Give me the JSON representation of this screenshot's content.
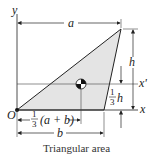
{
  "diagram": {
    "caption": "Triangular area",
    "labels": {
      "y_axis": "y",
      "x_axis": "x",
      "x_prime_axis": "x'",
      "origin": "O",
      "dim_a": "a",
      "dim_b": "b",
      "dim_h": "h",
      "centroid_x_num": "1",
      "centroid_x_den": "3",
      "centroid_x_expr": "(a + b)",
      "centroid_y_num": "1",
      "centroid_y_den": "3",
      "centroid_y_expr": "h"
    },
    "colors": {
      "fill": "#e4e4e4",
      "stroke": "#222222"
    }
  }
}
